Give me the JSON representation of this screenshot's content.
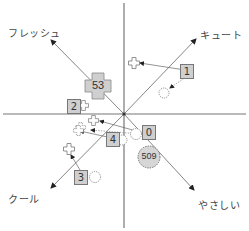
{
  "diagram": {
    "type": "positioning-map",
    "center": {
      "x": 124,
      "y": 114
    },
    "axes": {
      "fresh": {
        "label": "フレッシュ",
        "direction": "upper-left"
      },
      "cute": {
        "label": "キュート",
        "direction": "upper-right"
      },
      "cool": {
        "label": "クール",
        "direction": "lower-left"
      },
      "gentle": {
        "label": "やさしい",
        "direction": "lower-right"
      }
    },
    "items": [
      {
        "id": "53",
        "label": "53",
        "shape": "cross-badge"
      },
      {
        "id": "1",
        "label": "1",
        "shape": "box"
      },
      {
        "id": "2",
        "label": "2",
        "shape": "box"
      },
      {
        "id": "0",
        "label": "0",
        "shape": "box"
      },
      {
        "id": "4",
        "label": "4",
        "shape": "box"
      },
      {
        "id": "3",
        "label": "3",
        "shape": "box"
      },
      {
        "id": "509",
        "label": "509",
        "shape": "dotted-circle-badge"
      }
    ],
    "colors": {
      "line": "#555555",
      "axis": "#777777",
      "box_fill": "#cfcfcf",
      "box_border": "#777777",
      "text": "#444444"
    }
  }
}
